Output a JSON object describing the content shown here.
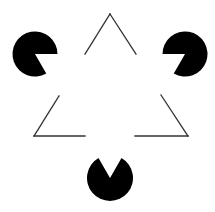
{
  "figure": {
    "background": "#ffffff",
    "fill_color": "#000000",
    "line_color": "#333333",
    "line_width": 1.3
  },
  "inducers": [
    {
      "name": "top-left",
      "cx": 35,
      "cy": 54,
      "r": 22.5,
      "mouth_start_deg": 0,
      "mouth_end_deg": 60
    },
    {
      "name": "top-right",
      "cx": 185,
      "cy": 54,
      "r": 22.5,
      "mouth_start_deg": 120,
      "mouth_end_deg": 180
    },
    {
      "name": "bottom",
      "cx": 110,
      "cy": 178,
      "r": 23,
      "mouth_start_deg": 240,
      "mouth_end_deg": 300
    }
  ],
  "outline_segments": [
    {
      "name": "apex-left",
      "points": [
        [
          85,
          54
        ],
        [
          110,
          14
        ]
      ]
    },
    {
      "name": "apex-right",
      "points": [
        [
          110,
          14
        ],
        [
          136,
          54
        ]
      ]
    },
    {
      "name": "bottom-left-diag",
      "points": [
        [
          59,
          96
        ],
        [
          34,
          136
        ]
      ]
    },
    {
      "name": "bottom-left-horiz",
      "points": [
        [
          34,
          136
        ],
        [
          85,
          136
        ]
      ]
    },
    {
      "name": "bottom-right-diag",
      "points": [
        [
          161,
          95
        ],
        [
          188,
          136
        ]
      ]
    },
    {
      "name": "bottom-right-horiz",
      "points": [
        [
          188,
          136
        ],
        [
          135,
          136
        ]
      ]
    }
  ]
}
